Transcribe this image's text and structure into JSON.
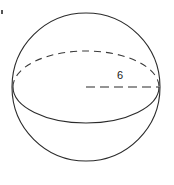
{
  "figure": {
    "kind": "sphere-with-radius-diagram",
    "background_color": "#ffffff",
    "line_color": "#2b2b2b",
    "dashed_line_color": "#3a3a3a",
    "label_color": "#1a1a1a",
    "sphere": {
      "name": "sphere-outline",
      "center_x": 86,
      "center_y": 87,
      "radius": 74
    },
    "equator": {
      "name": "equator-ellipse",
      "center_x": 86,
      "center_y": 87,
      "radius_x": 73,
      "radius_y": 36,
      "front_half_style": "solid",
      "back_half_style": "dashed"
    },
    "radius_line": {
      "name": "radius-segment",
      "style": "dashed",
      "from_x": 86,
      "from_y": 87,
      "to_x": 159,
      "to_y": 87,
      "label": "6"
    },
    "artifact": {
      "name": "corner-speck",
      "x": 1,
      "y": 10
    }
  }
}
